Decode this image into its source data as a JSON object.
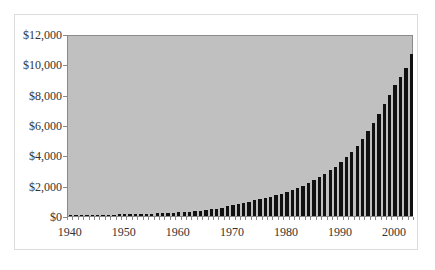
{
  "chart_data": {
    "type": "bar",
    "title": "",
    "xlabel": "",
    "ylabel": "",
    "ylim": [
      0,
      12000
    ],
    "xlim": [
      1940,
      2003
    ],
    "grid": false,
    "legend": null,
    "y_tick_labels": [
      "$0",
      "$2,000",
      "$4,000",
      "$6,000",
      "$8,000",
      "$10,000",
      "$12,000"
    ],
    "y_tick_values": [
      0,
      2000,
      4000,
      6000,
      8000,
      10000,
      12000
    ],
    "x_tick_labels": [
      "1940",
      "1950",
      "1960",
      "1970",
      "1980",
      "1990",
      "2000"
    ],
    "x_tick_values": [
      1940,
      1950,
      1960,
      1970,
      1980,
      1990,
      2000
    ],
    "categories": [
      1940,
      1941,
      1942,
      1943,
      1944,
      1945,
      1946,
      1947,
      1948,
      1949,
      1950,
      1951,
      1952,
      1953,
      1954,
      1955,
      1956,
      1957,
      1958,
      1959,
      1960,
      1961,
      1962,
      1963,
      1964,
      1965,
      1966,
      1967,
      1968,
      1969,
      1970,
      1971,
      1972,
      1973,
      1974,
      1975,
      1976,
      1977,
      1978,
      1979,
      1980,
      1981,
      1982,
      1983,
      1984,
      1985,
      1986,
      1987,
      1988,
      1989,
      1990,
      1991,
      1992,
      1993,
      1994,
      1995,
      1996,
      1997,
      1998,
      1999,
      2000,
      2001,
      2002,
      2003
    ],
    "values": [
      60,
      65,
      70,
      75,
      80,
      85,
      90,
      95,
      100,
      105,
      110,
      120,
      130,
      140,
      150,
      165,
      180,
      195,
      210,
      230,
      250,
      275,
      300,
      330,
      360,
      400,
      450,
      500,
      560,
      640,
      720,
      800,
      880,
      960,
      1050,
      1130,
      1210,
      1300,
      1400,
      1500,
      1620,
      1750,
      1880,
      2030,
      2200,
      2400,
      2600,
      2820,
      3050,
      3300,
      3600,
      3950,
      4300,
      4700,
      5150,
      5650,
      6200,
      6800,
      7450,
      8100,
      8750,
      9300,
      9900,
      10800
    ],
    "bar_color": "#111111",
    "plot_background": "#c0c0c0"
  }
}
